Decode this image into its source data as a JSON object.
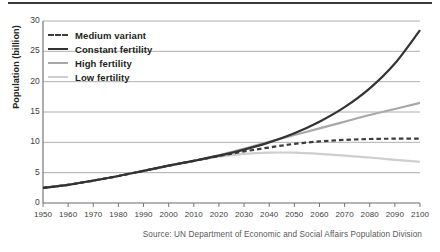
{
  "source_note": "Source: UN Department of Economic and Social Affairs Population Division",
  "chart_data": {
    "type": "line",
    "title": "",
    "xlabel": "",
    "ylabel": "Population (billion)",
    "xlim": [
      1950,
      2100
    ],
    "ylim": [
      0,
      30
    ],
    "ytick_step": 5,
    "xtick_step": 10,
    "grid": true,
    "grid_axis": "y",
    "legend_position": "top-left",
    "xticks": [
      1950,
      1960,
      1970,
      1980,
      1990,
      2000,
      2010,
      2020,
      2030,
      2040,
      2050,
      2060,
      2070,
      2080,
      2090,
      2100
    ],
    "yticks": [
      0,
      5,
      10,
      15,
      20,
      25,
      30
    ],
    "x": [
      1950,
      1960,
      1970,
      1980,
      1990,
      2000,
      2010,
      2020,
      2030,
      2040,
      2050,
      2060,
      2070,
      2080,
      2090,
      2100
    ],
    "series": [
      {
        "name": "Medium variant",
        "color": "#3c3c3c",
        "style": "dashed",
        "width": 2.2,
        "values": [
          2.5,
          3.0,
          3.7,
          4.45,
          5.3,
          6.15,
          6.95,
          7.75,
          8.5,
          9.15,
          9.75,
          10.15,
          10.4,
          10.55,
          10.6,
          10.6
        ]
      },
      {
        "name": "Constant fertility",
        "color": "#333333",
        "style": "solid",
        "width": 2.2,
        "values": [
          2.5,
          3.0,
          3.7,
          4.45,
          5.3,
          6.15,
          6.95,
          7.8,
          8.8,
          10.0,
          11.5,
          13.4,
          15.8,
          18.9,
          23.0,
          28.5
        ]
      },
      {
        "name": "High fertility",
        "color": "#a8a8a8",
        "style": "solid",
        "width": 2.2,
        "values": [
          2.5,
          3.0,
          3.7,
          4.45,
          5.3,
          6.15,
          6.95,
          7.85,
          8.95,
          10.1,
          11.2,
          12.3,
          13.4,
          14.5,
          15.5,
          16.5
        ]
      },
      {
        "name": "Low fertility",
        "color": "#cfcfcf",
        "style": "solid",
        "width": 2.2,
        "values": [
          2.5,
          3.0,
          3.7,
          4.45,
          5.3,
          6.15,
          6.95,
          7.65,
          8.1,
          8.3,
          8.3,
          8.1,
          7.8,
          7.5,
          7.1,
          6.8
        ]
      }
    ]
  }
}
